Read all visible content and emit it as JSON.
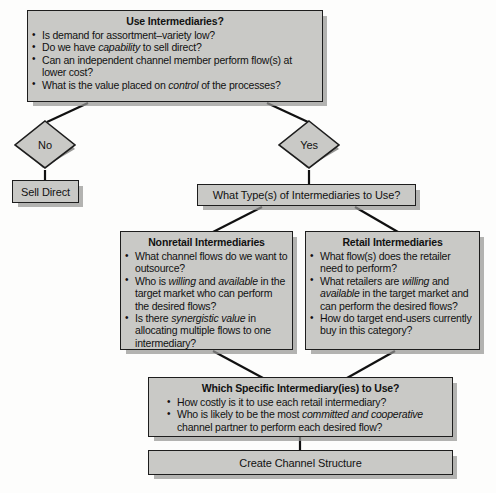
{
  "diagram": {
    "type": "flowchart",
    "colors": {
      "node_fill": "#c9c9c6",
      "node_border": "#1d1d1d",
      "shadow": "#969694",
      "background": "#fdfdfc",
      "text": "#111111"
    },
    "nodes": {
      "use_intermediaries": {
        "title": "Use Intermediaries?",
        "bullets": [
          "Is demand for assortment–variety low?",
          "Do we have <i>capability</i> to sell direct?",
          "Can an independent channel member perform flow(s) at lower cost?",
          "What is the value placed on <i>control</i> of the processes?"
        ]
      },
      "decision_no": {
        "label": "No"
      },
      "decision_yes": {
        "label": "Yes"
      },
      "sell_direct": {
        "label": "Sell Direct"
      },
      "what_type": {
        "label": "What Type(s) of Intermediaries to Use?"
      },
      "nonretail": {
        "title": "Nonretail Intermediaries",
        "bullets": [
          "What channel flows do we want to outsource?",
          "Who is <i>willing</i> and <i>available</i> in the target market who can perform the desired flows?",
          "Is there <i>synergistic value</i> in allocating multiple flows to one intermediary?"
        ]
      },
      "retail": {
        "title": "Retail Intermediaries",
        "bullets": [
          "What flow(s) does the retailer need to perform?",
          "What retailers are <i>willing</i> and <i>available</i> in the target market and can perform the desired flows?",
          "How do target end-users currently buy in this category?"
        ]
      },
      "which_specific": {
        "title": "Which Specific Intermediary(ies) to Use?",
        "bullets": [
          "How costly is it to use each retail intermediary?",
          "Who is likely to be the most <i>committed and cooperative</i> channel partner to perform each desired flow?"
        ]
      },
      "create_channel": {
        "label": "Create Channel Structure"
      }
    },
    "edges": [
      {
        "from": "use_intermediaries",
        "to": "decision_no"
      },
      {
        "from": "use_intermediaries",
        "to": "decision_yes"
      },
      {
        "from": "decision_no",
        "to": "sell_direct"
      },
      {
        "from": "decision_yes",
        "to": "what_type"
      },
      {
        "from": "what_type",
        "to": "nonretail"
      },
      {
        "from": "what_type",
        "to": "retail"
      },
      {
        "from": "nonretail",
        "to": "which_specific"
      },
      {
        "from": "retail",
        "to": "which_specific"
      },
      {
        "from": "which_specific",
        "to": "create_channel"
      }
    ]
  }
}
